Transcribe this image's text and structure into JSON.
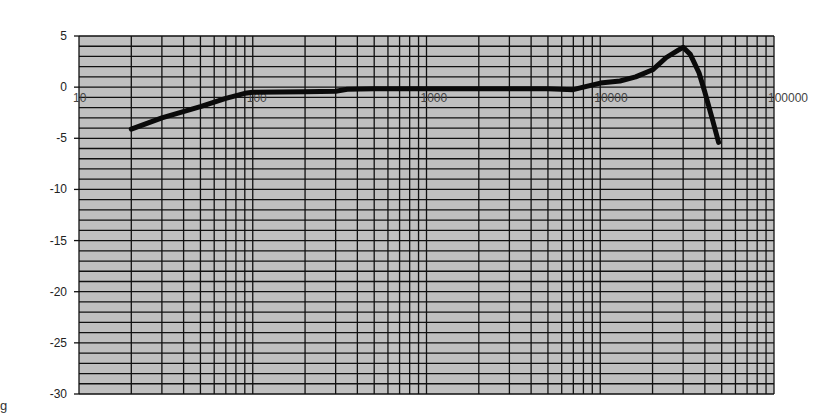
{
  "chart_data": {
    "type": "line",
    "title": "",
    "xlabel": "",
    "ylabel": "",
    "x_scale": "log",
    "xlim": [
      10,
      100000
    ],
    "ylim": [
      -30,
      5
    ],
    "grid": true,
    "legend": null,
    "y_ticks": [
      "5",
      "0",
      "-5",
      "-10",
      "-15",
      "-20",
      "-25",
      "-30"
    ],
    "y_tick_values": [
      5,
      0,
      -5,
      -10,
      -15,
      -20,
      -25,
      -30
    ],
    "x_ticks": [
      "10",
      "100",
      "1000",
      "10000",
      "100000"
    ],
    "x_tick_values": [
      10,
      100,
      1000,
      10000,
      100000
    ],
    "series": [
      {
        "name": "response",
        "x": [
          20,
          30,
          50,
          70,
          90,
          100,
          200,
          300,
          350,
          500,
          1000,
          2000,
          5000,
          7000,
          8000,
          10000,
          13000,
          16000,
          20000,
          24000,
          28000,
          30000,
          33000,
          37000,
          40000,
          44000,
          48000
        ],
        "values": [
          -4.1,
          -3.0,
          -1.9,
          -1.1,
          -0.6,
          -0.5,
          -0.45,
          -0.4,
          -0.2,
          -0.15,
          -0.15,
          -0.15,
          -0.15,
          -0.25,
          0.0,
          0.4,
          0.6,
          1.0,
          1.7,
          2.9,
          3.6,
          3.9,
          3.2,
          1.4,
          -0.5,
          -3.0,
          -5.4
        ]
      }
    ],
    "colors": {
      "plot_bg": "#c0c0c0",
      "grid": "#111111",
      "line": "#0a0a0a"
    }
  },
  "edge_glyph": "g"
}
